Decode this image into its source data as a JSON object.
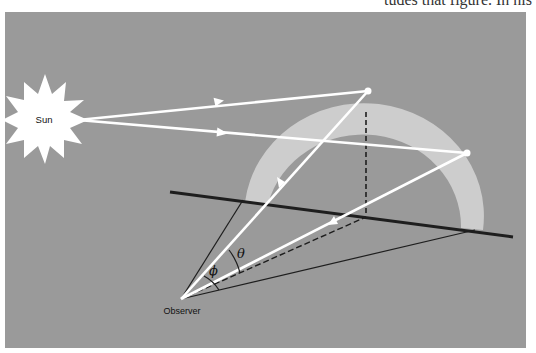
{
  "header_fragment": "tudes that figure. In his",
  "diagram": {
    "labels": {
      "sun": "Sun",
      "observer": "Observer",
      "theta": "θ",
      "phi": "ϕ"
    },
    "colors": {
      "panel": "#9a9a9a",
      "rainbow_band": "#cfcfcf",
      "rays": "#ffffff",
      "ground_lines": "#1e1e1e",
      "sun": "#ffffff"
    }
  }
}
